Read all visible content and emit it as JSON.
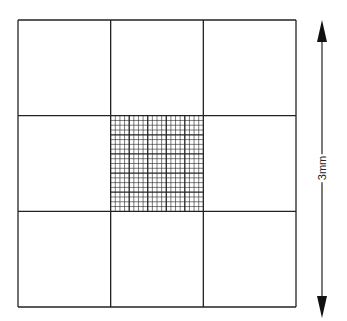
{
  "diagram": {
    "outer_grid": {
      "rows": 3,
      "cols": 3,
      "x0": 18,
      "y0": 20,
      "x1": 296,
      "y1": 307
    },
    "center_square": {
      "major_divisions": 5,
      "minor_per_major": 4
    },
    "line_color": "#222222",
    "dimension": {
      "label": "3mm",
      "direction": "vertical",
      "arrow_x": 322,
      "top_y": 20,
      "bottom_y": 318
    }
  }
}
